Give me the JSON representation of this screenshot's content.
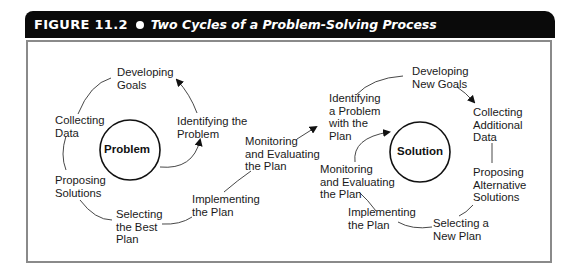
{
  "figure": {
    "number": "FIGURE 11.2",
    "title": "Two Cycles of a Problem-Solving Process",
    "header_bg": "#0a0a0a",
    "frame_border": "#8a8a8a"
  },
  "cycle1": {
    "center": "Problem",
    "steps": {
      "developing_goals": "Developing\nGoals",
      "identifying_problem": "Identifying the\nProblem",
      "collecting_data": "Collecting\nData",
      "proposing_solutions": "Proposing\nSolutions",
      "selecting_best_plan": "Selecting\nthe Best\nPlan",
      "implementing_plan": "Implementing\nthe Plan",
      "monitoring_evaluating": "Monitoring\nand Evaluating\nthe Plan"
    }
  },
  "cycle2": {
    "center": "Solution",
    "steps": {
      "identifying_problem_with_plan": "Identifying\na Problem\nwith the\nPlan",
      "developing_new_goals": "Developing\nNew Goals",
      "collecting_additional_data": "Collecting\nAdditional\nData",
      "proposing_alternative_solutions": "Proposing\nAlternative\nSolutions",
      "selecting_new_plan": "Selecting a\nNew Plan",
      "implementing_plan": "Implementing\nthe Plan",
      "monitoring_evaluating": "Monitoring\nand Evaluating\nthe Plan"
    }
  }
}
